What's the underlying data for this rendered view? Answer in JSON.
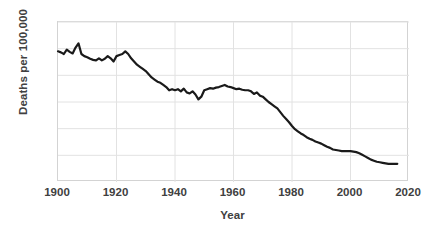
{
  "chart_data": {
    "type": "line",
    "title": "",
    "xlabel": "Year",
    "ylabel": "Deaths per 100,000",
    "xlim": [
      1900,
      2020
    ],
    "ylim": [
      0,
      300
    ],
    "xticks": [
      1900,
      1920,
      1940,
      1960,
      1980,
      2000,
      2020
    ],
    "yticks": [
      0,
      50,
      100,
      150,
      200,
      250,
      300
    ],
    "grid": true,
    "legend": null,
    "line_color": "#1a1a1a",
    "line_width": 2.2,
    "x": [
      1900,
      1901,
      1902,
      1903,
      1904,
      1905,
      1906,
      1907,
      1908,
      1909,
      1910,
      1911,
      1912,
      1913,
      1914,
      1915,
      1916,
      1917,
      1918,
      1919,
      1920,
      1921,
      1922,
      1923,
      1924,
      1925,
      1926,
      1927,
      1928,
      1929,
      1930,
      1931,
      1932,
      1933,
      1934,
      1935,
      1936,
      1937,
      1938,
      1939,
      1940,
      1941,
      1942,
      1943,
      1944,
      1945,
      1946,
      1947,
      1948,
      1949,
      1950,
      1951,
      1952,
      1953,
      1954,
      1955,
      1956,
      1957,
      1958,
      1959,
      1960,
      1961,
      1962,
      1963,
      1964,
      1965,
      1966,
      1967,
      1968,
      1969,
      1970,
      1971,
      1972,
      1973,
      1974,
      1975,
      1976,
      1977,
      1978,
      1979,
      1980,
      1981,
      1982,
      1983,
      1984,
      1985,
      1986,
      1987,
      1988,
      1989,
      1990,
      1991,
      1992,
      1993,
      1994,
      1995,
      1996,
      1997,
      1998,
      1999,
      2000,
      2001,
      2002,
      2003,
      2004,
      2005,
      2006,
      2007,
      2008,
      2009,
      2010,
      2011,
      2012,
      2013,
      2014,
      2015,
      2016
    ],
    "values": [
      245,
      243,
      240,
      248,
      244,
      241,
      252,
      260,
      240,
      236,
      234,
      231,
      229,
      228,
      232,
      228,
      231,
      236,
      232,
      226,
      236,
      238,
      240,
      245,
      240,
      232,
      226,
      220,
      216,
      212,
      208,
      202,
      196,
      192,
      188,
      186,
      182,
      178,
      172,
      174,
      172,
      174,
      170,
      175,
      168,
      166,
      170,
      164,
      155,
      160,
      172,
      174,
      176,
      175,
      177,
      178,
      180,
      182,
      179,
      178,
      176,
      174,
      175,
      173,
      172,
      172,
      170,
      165,
      168,
      162,
      160,
      155,
      150,
      146,
      142,
      138,
      131,
      124,
      118,
      112,
      105,
      99,
      95,
      91,
      88,
      84,
      81,
      79,
      76,
      74,
      72,
      69,
      66,
      64,
      61,
      60,
      59,
      58,
      58,
      58,
      58,
      57,
      56,
      54,
      51,
      48,
      45,
      42,
      40,
      38,
      37,
      36,
      35,
      34,
      34,
      34,
      34
    ]
  },
  "axis": {
    "x_tick_labels": [
      "1900",
      "1920",
      "1940",
      "1960",
      "1980",
      "2000",
      "2020"
    ],
    "y_tick_labels": [
      "0",
      "50",
      "100",
      "150",
      "200",
      "250",
      "300"
    ],
    "x_axis_title": "Year",
    "y_axis_title": "Deaths per 100,000"
  },
  "colors": {
    "line": "#1a1a1a",
    "grid": "#e2e2e2",
    "frame": "#d3d3d3",
    "text": "#404040",
    "background": "#ffffff"
  }
}
